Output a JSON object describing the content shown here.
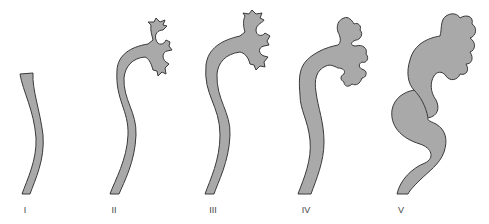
{
  "diagram": {
    "fill_color": "#a9a9a9",
    "stroke_color": "#3a3a3a",
    "grades": [
      {
        "label": "I"
      },
      {
        "label": "II"
      },
      {
        "label": "III"
      },
      {
        "label": "IV"
      },
      {
        "label": "V"
      }
    ]
  }
}
